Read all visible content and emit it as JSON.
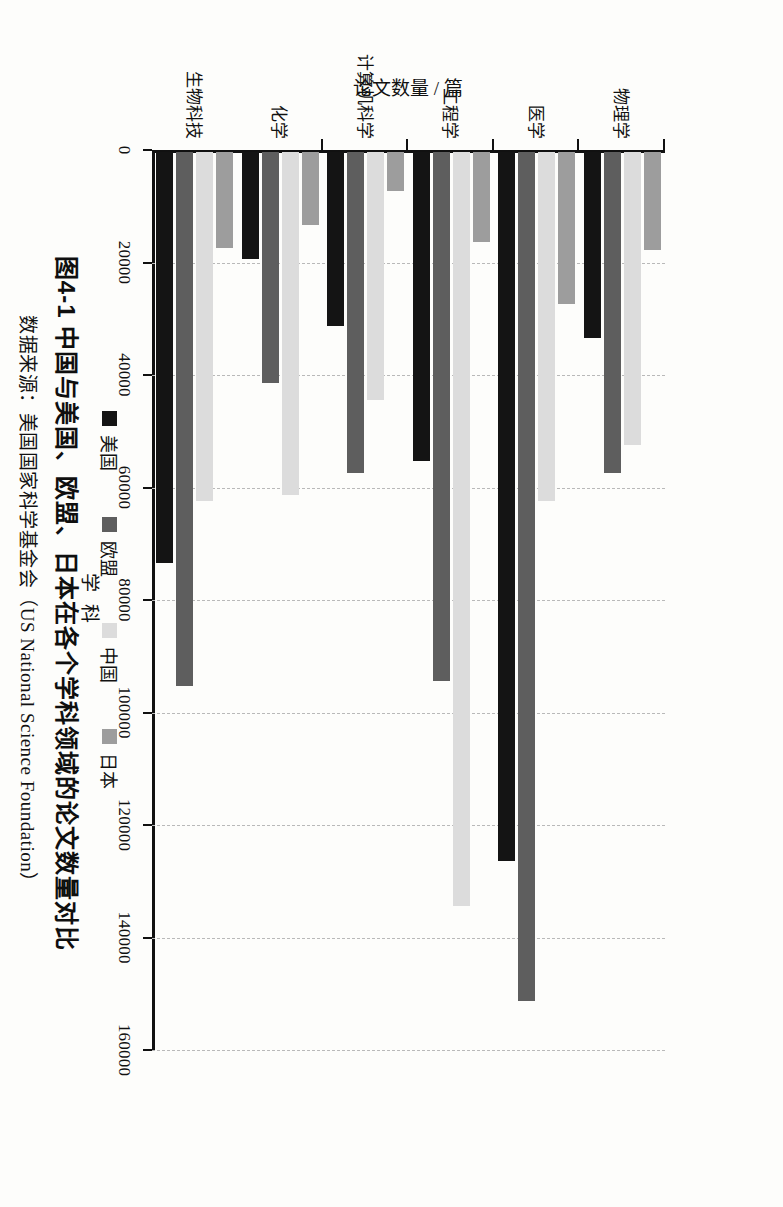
{
  "figure": {
    "caption": "图4-1  中国与美国、欧盟、日本在各个学科领域的论文数量对比",
    "source": "数据来源：美国国家科学基金会（US National Science Foundation）"
  },
  "legend": {
    "position": "bottom",
    "items": [
      {
        "label": "美国",
        "color": "#141414",
        "swatch": "legend-swatch-usa"
      },
      {
        "label": "欧盟",
        "color": "#5e5e5e",
        "swatch": "legend-swatch-eu"
      },
      {
        "label": "中国",
        "color": "#dcdcdc",
        "swatch": "legend-swatch-china"
      },
      {
        "label": "日本",
        "color": "#9d9d9d",
        "swatch": "legend-swatch-japan"
      }
    ]
  },
  "axes": {
    "value_axis_title": "论文数量 / 篇",
    "category_axis_title": "学 科",
    "ticklabels": [
      "0",
      "20000",
      "40000",
      "60000",
      "80000",
      "100000",
      "120000",
      "140000",
      "160000"
    ]
  },
  "chart_data": {
    "type": "bar",
    "orientation": "horizontal-grouped",
    "title": "图4-1  中国与美国、欧盟、日本在各个学科领域的论文数量对比",
    "xlabel": "学 科",
    "ylabel": "论文数量 / 篇",
    "ylim": [
      0,
      160000
    ],
    "ytick_step": 20000,
    "grid": true,
    "legend_position": "bottom",
    "categories": [
      "生物科技",
      "化学",
      "计算机科学",
      "工程学",
      "医学",
      "物理学"
    ],
    "series": [
      {
        "name": "美国",
        "color": "#141414",
        "values": [
          73000,
          19000,
          31000,
          55000,
          126000,
          33000
        ]
      },
      {
        "name": "欧盟",
        "color": "#5e5e5e",
        "values": [
          95000,
          41000,
          57000,
          94000,
          151000,
          57000
        ]
      },
      {
        "name": "中国",
        "color": "#dcdcdc",
        "values": [
          62000,
          61000,
          44000,
          134000,
          62000,
          52000
        ]
      },
      {
        "name": "日本",
        "color": "#9d9d9d",
        "values": [
          17000,
          13000,
          7000,
          16000,
          27000,
          17500
        ]
      }
    ]
  }
}
